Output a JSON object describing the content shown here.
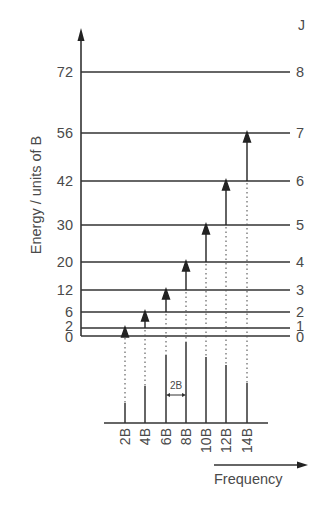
{
  "y_axis": {
    "label": "Energy / units of B",
    "ticks": [
      "72",
      "56",
      "42",
      "30",
      "20",
      "12",
      "6",
      "2",
      "0"
    ]
  },
  "j_header": "J",
  "levels": [
    {
      "J": "8",
      "energy": "72"
    },
    {
      "J": "7",
      "energy": "56"
    },
    {
      "J": "6",
      "energy": "42"
    },
    {
      "J": "5",
      "energy": "30"
    },
    {
      "J": "4",
      "energy": "20"
    },
    {
      "J": "3",
      "energy": "12"
    },
    {
      "J": "2",
      "energy": "6"
    },
    {
      "J": "1",
      "energy": "2"
    },
    {
      "J": "0",
      "energy": "0"
    }
  ],
  "transitions": [
    {
      "from": "0",
      "to": "1",
      "freq": "2B"
    },
    {
      "from": "1",
      "to": "2",
      "freq": "4B"
    },
    {
      "from": "2",
      "to": "3",
      "freq": "6B"
    },
    {
      "from": "3",
      "to": "4",
      "freq": "8B"
    },
    {
      "from": "4",
      "to": "5",
      "freq": "10B"
    },
    {
      "from": "5",
      "to": "6",
      "freq": "12B"
    },
    {
      "from": "6",
      "to": "7",
      "freq": "14B"
    }
  ],
  "spectrum": {
    "lines": [
      "2B",
      "4B",
      "6B",
      "8B",
      "10B",
      "12B",
      "14B"
    ],
    "spacing_label": "2B",
    "x_label": "Frequency"
  }
}
